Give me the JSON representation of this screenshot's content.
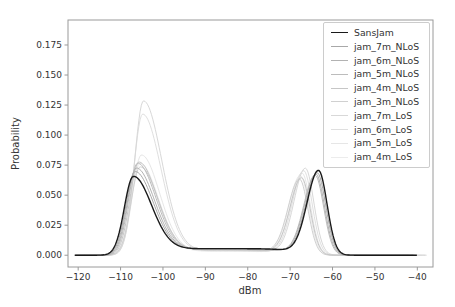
{
  "chart_data": {
    "type": "line",
    "title": "",
    "xlabel": "dBm",
    "ylabel": "Probability",
    "xlim": [
      -122.4,
      -36.3
    ],
    "ylim": [
      -0.0098,
      0.1958
    ],
    "x_ticks": [
      -120,
      -110,
      -100,
      -90,
      -80,
      -70,
      -60,
      -50,
      -40
    ],
    "y_ticks": [
      0.0,
      0.025,
      0.05,
      0.075,
      0.1,
      0.125,
      0.15,
      0.175
    ],
    "x_tick_labels": [
      "−120",
      "−110",
      "−100",
      "−90",
      "−80",
      "−70",
      "−60",
      "−50",
      "−40"
    ],
    "y_tick_labels": [
      "0.000",
      "0.025",
      "0.050",
      "0.075",
      "0.100",
      "0.125",
      "0.150",
      "0.175"
    ],
    "grid": false,
    "legend_position": "upper right",
    "series": [
      {
        "name": "SansJam",
        "color": "#1a1a1a",
        "line_width": 1.4,
        "left_peak": {
          "center_dbm": -107.0,
          "height": 0.065
        },
        "right_peak": {
          "center_dbm": -63.3,
          "height": 0.07
        },
        "valley_level": 0.0055,
        "x_range": [
          -120.8,
          -40.0
        ]
      },
      {
        "name": "jam_7m_NLoS",
        "color": "#a8a8a8",
        "line_width": 1.0,
        "left_peak": {
          "center_dbm": -106.6,
          "height": 0.069
        },
        "right_peak": {
          "center_dbm": -63.6,
          "height": 0.068
        },
        "valley_level": 0.0052,
        "x_range": [
          -120.8,
          -40.5
        ]
      },
      {
        "name": "jam_6m_NLoS",
        "color": "#b2b2b2",
        "line_width": 1.0,
        "left_peak": {
          "center_dbm": -106.3,
          "height": 0.072
        },
        "right_peak": {
          "center_dbm": -63.9,
          "height": 0.067
        },
        "valley_level": 0.005,
        "x_range": [
          -120.8,
          -41.0
        ]
      },
      {
        "name": "jam_5m_NLoS",
        "color": "#bcbcbc",
        "line_width": 1.0,
        "left_peak": {
          "center_dbm": -106.0,
          "height": 0.076
        },
        "right_peak": {
          "center_dbm": -64.1,
          "height": 0.066
        },
        "valley_level": 0.0048,
        "x_range": [
          -120.5,
          -41.0
        ]
      },
      {
        "name": "jam_4m_NLoS",
        "color": "#c6c6c6",
        "line_width": 1.0,
        "left_peak": {
          "center_dbm": -105.7,
          "height": 0.077
        },
        "right_peak": {
          "center_dbm": -67.3,
          "height": 0.064
        },
        "valley_level": 0.0046,
        "x_range": [
          -120.5,
          -42.0
        ]
      },
      {
        "name": "jam_3m_NLoS",
        "color": "#d0d0d0",
        "line_width": 1.0,
        "left_peak": {
          "center_dbm": -105.4,
          "height": 0.073
        },
        "right_peak": {
          "center_dbm": -67.8,
          "height": 0.063
        },
        "valley_level": 0.0044,
        "x_range": [
          -120.0,
          -42.0
        ]
      },
      {
        "name": "jam_7m_LoS",
        "color": "#d8d8d8",
        "line_width": 1.0,
        "left_peak": {
          "center_dbm": -104.6,
          "height": 0.128
        },
        "right_peak": {
          "center_dbm": -66.4,
          "height": 0.072
        },
        "valley_level": 0.004,
        "x_range": [
          -119.5,
          -38.0
        ]
      },
      {
        "name": "jam_6m_LoS",
        "color": "#dfdfdf",
        "line_width": 1.0,
        "left_peak": {
          "center_dbm": -104.8,
          "height": 0.117
        },
        "right_peak": {
          "center_dbm": -66.8,
          "height": 0.07
        },
        "valley_level": 0.0038,
        "x_range": [
          -119.5,
          -37.8
        ]
      },
      {
        "name": "jam_5m_LoS",
        "color": "#e6e6e6",
        "line_width": 1.0,
        "left_peak": {
          "center_dbm": -105.1,
          "height": 0.083
        },
        "right_peak": {
          "center_dbm": -67.2,
          "height": 0.068
        },
        "valley_level": 0.0036,
        "x_range": [
          -119.0,
          -37.8
        ]
      },
      {
        "name": "jam_4m_LoS",
        "color": "#ececec",
        "line_width": 1.0,
        "left_peak": {
          "center_dbm": -105.4,
          "height": 0.076
        },
        "right_peak": {
          "center_dbm": -67.6,
          "height": 0.066
        },
        "valley_level": 0.0034,
        "x_range": [
          -119.0,
          -37.7
        ]
      }
    ]
  },
  "colors": {
    "background": "#ffffff",
    "spine": "#9a9a9a",
    "text": "#333333",
    "legend_border": "#cccccc"
  }
}
